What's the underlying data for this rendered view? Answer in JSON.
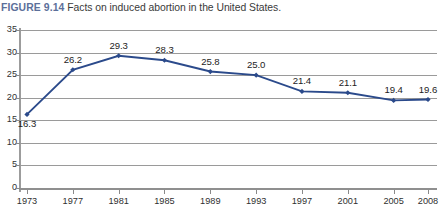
{
  "caption": {
    "figure_number": "FIGURE 9.14",
    "text": "Facts on induced abortion in the United States."
  },
  "colors": {
    "series_line": "#2b4a8b",
    "marker": "#2b4a8b",
    "gridline": "#9a9a9a",
    "axis": "#8f8f8f",
    "figure_number": "#5c6f9a",
    "caption_text": "#3a3a3a",
    "plot_background": "#ffffff"
  },
  "chart_data": {
    "type": "line",
    "title": "Facts on induced abortion in the United States.",
    "xlabel": "",
    "ylabel": "",
    "categories": [
      "1973",
      "1977",
      "1981",
      "1985",
      "1989",
      "1993",
      "1997",
      "2001",
      "2005",
      "2008"
    ],
    "values": [
      16.3,
      26.2,
      29.3,
      28.3,
      25.8,
      25.0,
      21.4,
      21.1,
      19.4,
      19.6
    ],
    "data_labels": [
      "16.3",
      "26.2",
      "29.3",
      "28.3",
      "25.8",
      "25.0",
      "21.4",
      "21.1",
      "19.4",
      "19.6"
    ],
    "label_positions": [
      "below",
      "above",
      "above",
      "above",
      "above",
      "above",
      "above",
      "above",
      "above",
      "above"
    ],
    "ylim": [
      0,
      35
    ],
    "yticks": [
      0,
      5,
      10,
      15,
      20,
      25,
      30,
      35
    ],
    "ytick_labels": [
      "0",
      "5",
      "10",
      "15",
      "20",
      "25",
      "30",
      "35"
    ],
    "grid": true,
    "grid_axis": "y",
    "legend": false,
    "legend_position": "none",
    "markers": "diamond",
    "series": [
      {
        "name": "Abortion rate",
        "values": [
          16.3,
          26.2,
          29.3,
          28.3,
          25.8,
          25.0,
          21.4,
          21.1,
          19.4,
          19.6
        ]
      }
    ]
  }
}
